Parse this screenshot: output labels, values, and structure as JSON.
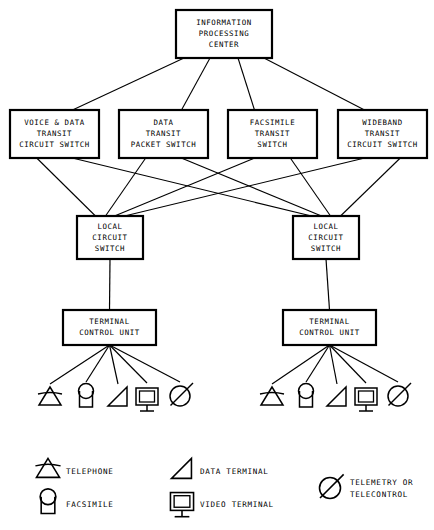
{
  "diagram": {
    "colors": {
      "background": "#ffffff",
      "stroke": "#000000",
      "box_fill": "#ffffff"
    },
    "nodes": {
      "center": {
        "name": "information-processing-center",
        "lines": [
          "INFORMATION",
          "PROCESSING",
          "CENTER"
        ],
        "x": 176,
        "y": 10,
        "w": 96,
        "h": 48
      },
      "transit": [
        {
          "name": "voice-data-transit-circuit-switch",
          "lines": [
            "VOICE & DATA",
            "TRANSIT",
            "CIRCUIT SWITCH"
          ],
          "x": 10,
          "y": 110,
          "w": 89,
          "h": 48
        },
        {
          "name": "data-transit-packet-switch",
          "lines": [
            "DATA",
            "TRANSIT",
            "PACKET SWITCH"
          ],
          "x": 119,
          "y": 110,
          "w": 89,
          "h": 48
        },
        {
          "name": "facsimile-transit-switch",
          "lines": [
            "FACSIMILE",
            "TRANSIT",
            "SWITCH"
          ],
          "x": 228,
          "y": 110,
          "w": 89,
          "h": 48
        },
        {
          "name": "wideband-transit-circuit-switch",
          "lines": [
            "WIDEBAND",
            "TRANSIT",
            "CIRCUIT SWITCH"
          ],
          "x": 338,
          "y": 110,
          "w": 89,
          "h": 48
        }
      ],
      "local": [
        {
          "name": "local-circuit-switch-left",
          "lines": [
            "LOCAL",
            "CIRCUIT",
            "SWITCH"
          ],
          "x": 77,
          "y": 216,
          "w": 66,
          "h": 43
        },
        {
          "name": "local-circuit-switch-right",
          "lines": [
            "LOCAL",
            "CIRCUIT",
            "SWITCH"
          ],
          "x": 293,
          "y": 216,
          "w": 66,
          "h": 43
        }
      ],
      "control": [
        {
          "name": "terminal-control-unit-left",
          "lines": [
            "TERMINAL",
            "CONTROL UNIT"
          ],
          "x": 63,
          "y": 310,
          "w": 93,
          "h": 35
        },
        {
          "name": "terminal-control-unit-right",
          "lines": [
            "TERMINAL",
            "CONTROL UNIT"
          ],
          "x": 283,
          "y": 310,
          "w": 93,
          "h": 35
        }
      ]
    },
    "terminal_groups": [
      {
        "name": "terminal-group-left",
        "symbols": [
          {
            "name": "telephone-symbol",
            "type": "telephone",
            "cx": 50,
            "cy": 398
          },
          {
            "name": "facsimile-symbol",
            "type": "facsimile",
            "cx": 86,
            "cy": 396
          },
          {
            "name": "data-terminal-symbol",
            "type": "data-terminal",
            "cx": 118,
            "cy": 398
          },
          {
            "name": "video-terminal-symbol",
            "type": "video-terminal",
            "cx": 147,
            "cy": 397
          },
          {
            "name": "telemetry-symbol",
            "type": "telemetry",
            "cx": 180,
            "cy": 396
          }
        ]
      },
      {
        "name": "terminal-group-right",
        "symbols": [
          {
            "name": "telephone-symbol",
            "type": "telephone",
            "cx": 272,
            "cy": 398
          },
          {
            "name": "facsimile-symbol",
            "type": "facsimile",
            "cx": 306,
            "cy": 396
          },
          {
            "name": "data-terminal-symbol",
            "type": "data-terminal",
            "cx": 337,
            "cy": 398
          },
          {
            "name": "video-terminal-symbol",
            "type": "video-terminal",
            "cx": 366,
            "cy": 397
          },
          {
            "name": "telemetry-symbol",
            "type": "telemetry",
            "cx": 398,
            "cy": 396
          }
        ]
      }
    ],
    "legend": {
      "name": "symbol-legend",
      "items": [
        {
          "name": "legend-telephone",
          "type": "telephone",
          "label": "TELEPHONE",
          "sx": 48,
          "sy": 470,
          "tx": 66,
          "ty": 472
        },
        {
          "name": "legend-facsimile",
          "type": "facsimile",
          "label": "FACSIMILE",
          "sx": 48,
          "sy": 502,
          "tx": 66,
          "ty": 505
        },
        {
          "name": "legend-data-terminal",
          "type": "data-terminal",
          "label": "DATA TERMINAL",
          "sx": 182,
          "sy": 470,
          "tx": 200,
          "ty": 472
        },
        {
          "name": "legend-video-terminal",
          "type": "video-terminal",
          "label": "VIDEO TERMINAL",
          "sx": 182,
          "sy": 502,
          "tx": 200,
          "ty": 505
        },
        {
          "name": "legend-telemetry",
          "type": "telemetry",
          "label": "TELEMETRY OR",
          "label2": "TELECONTROL",
          "sx": 330,
          "sy": 488,
          "tx": 350,
          "ty": 483
        }
      ]
    }
  }
}
